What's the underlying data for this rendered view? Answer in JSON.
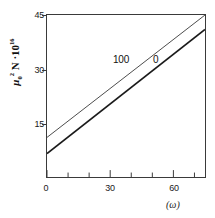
{
  "chart_data": {
    "type": "line",
    "title": "",
    "subtitle": "",
    "xlabel": "(ω)",
    "ylabel": "μ₀² N · 10¹⁶",
    "ylabel_parts": {
      "mu": "μ",
      "mu_sub": "0",
      "mu_sup": "2",
      "n": "N",
      "dot": "·",
      "ten": "10",
      "ten_exp": "16"
    },
    "xlim": [
      0,
      75
    ],
    "ylim": [
      0,
      45
    ],
    "xticks": [
      0,
      30,
      60
    ],
    "xtick_labels": [
      "0",
      "30",
      "60"
    ],
    "xticks_minor": [
      10,
      20,
      40,
      50,
      70
    ],
    "yticks": [
      15,
      30,
      45
    ],
    "ytick_labels": [
      "15",
      "30",
      "45"
    ],
    "grid": false,
    "legend_position": "inline-on-curves",
    "series": [
      {
        "name": "100",
        "label": "100",
        "color": "#4a4a4a",
        "linewidth": 1.0,
        "x": [
          0,
          75
        ],
        "values": [
          11.0,
          45.0
        ]
      },
      {
        "name": "0",
        "label": "0",
        "color": "#1a1a1a",
        "linewidth": 1.6,
        "x": [
          0,
          75
        ],
        "values": [
          6.5,
          41.0
        ]
      }
    ],
    "annotations": [
      {
        "text": "100",
        "x": 44,
        "y": 31.5
      },
      {
        "text": "0",
        "x": 58,
        "y": 31.5
      }
    ]
  },
  "axes": {
    "frame_color": "#3a3a3a",
    "background": "#ffffff"
  }
}
